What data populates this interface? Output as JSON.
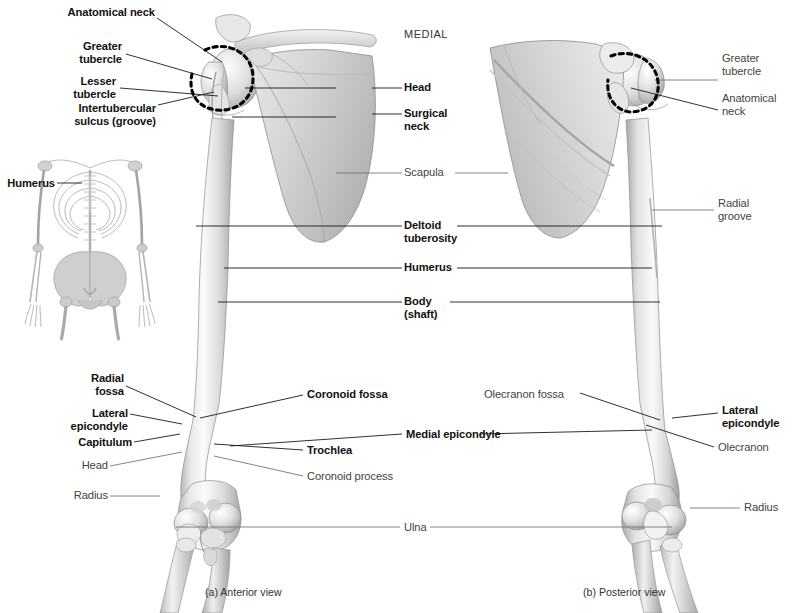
{
  "figure": {
    "orientation_note": "MEDIAL",
    "captions": {
      "a": "(a) Anterior view",
      "b": "(b) Posterior view"
    },
    "inset": {
      "label": "Humerus",
      "description": "skeleton-orientation-inset"
    }
  },
  "labels": {
    "left_anterior": [
      {
        "id": "anatomical-neck",
        "text": "Anatomical neck",
        "weight": "bold"
      },
      {
        "id": "greater-tubercle",
        "text": "Greater\ntubercle",
        "weight": "bold"
      },
      {
        "id": "lesser-tubercle",
        "text": "Lesser\ntubercle",
        "weight": "bold"
      },
      {
        "id": "intertubercular-sulcus",
        "text": "Intertubercular\nsulcus (groove)",
        "weight": "bold"
      },
      {
        "id": "radial-fossa",
        "text": "Radial\nfossa",
        "weight": "bold"
      },
      {
        "id": "lateral-epicondyle",
        "text": "Lateral\nepicondyle",
        "weight": "bold"
      },
      {
        "id": "capitulum",
        "text": "Capitulum",
        "weight": "bold"
      },
      {
        "id": "head-radius",
        "text": "Head",
        "weight": "regular"
      },
      {
        "id": "radius",
        "text": "Radius",
        "weight": "regular"
      }
    ],
    "center": [
      {
        "id": "head",
        "text": "Head",
        "weight": "bold"
      },
      {
        "id": "surgical-neck",
        "text": "Surgical\nneck",
        "weight": "bold"
      },
      {
        "id": "scapula",
        "text": "Scapula",
        "weight": "regular"
      },
      {
        "id": "deltoid-tuberosity",
        "text": "Deltoid\ntuberosity",
        "weight": "bold"
      },
      {
        "id": "humerus",
        "text": "Humerus",
        "weight": "bold"
      },
      {
        "id": "body-shaft",
        "text": "Body\n(shaft)",
        "weight": "bold"
      },
      {
        "id": "coronoid-fossa",
        "text": "Coronoid fossa",
        "weight": "bold"
      },
      {
        "id": "olecranon-fossa",
        "text": "Olecranon fossa",
        "weight": "regular"
      },
      {
        "id": "medial-epicondyle",
        "text": "Medial epicondyle",
        "weight": "bold"
      },
      {
        "id": "trochlea",
        "text": "Trochlea",
        "weight": "bold"
      },
      {
        "id": "coronoid-process",
        "text": "Coronoid process",
        "weight": "regular"
      },
      {
        "id": "ulna",
        "text": "Ulna",
        "weight": "regular"
      }
    ],
    "right_posterior": [
      {
        "id": "greater-tubercle-p",
        "text": "Greater\ntubercle",
        "weight": "regular"
      },
      {
        "id": "anatomical-neck-p",
        "text": "Anatomical\nneck",
        "weight": "regular"
      },
      {
        "id": "radial-groove",
        "text": "Radial\ngroove",
        "weight": "regular"
      },
      {
        "id": "lateral-epicondyle-p",
        "text": "Lateral\nepicondyle",
        "weight": "bold"
      },
      {
        "id": "olecranon",
        "text": "Olecranon",
        "weight": "regular"
      },
      {
        "id": "radius-p",
        "text": "Radius",
        "weight": "regular"
      }
    ]
  },
  "colors": {
    "background": "#ffffff",
    "bone_light": "#f4f4f4",
    "bone_mid": "#d2d2d2",
    "bone_shadow": "#9a9a9a",
    "leader_dark": "#1a1a1a",
    "leader_light": "#777777",
    "text_bold": "#111111",
    "text_regular": "#444444",
    "dashed_marker": "#000000"
  }
}
